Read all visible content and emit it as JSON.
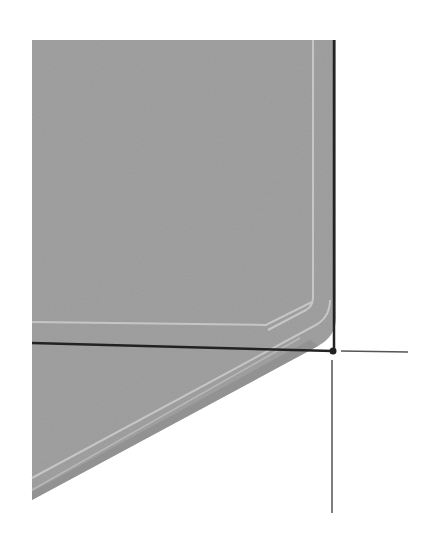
{
  "figure": {
    "caption": "",
    "colors": {
      "background": "#ffffff",
      "plate_fill": "#9a9a9a",
      "inner_outline": "#c4c4c4",
      "axis_line": "#222222",
      "thin_line": "#444444"
    },
    "plate": {
      "top_left": [
        32,
        40
      ],
      "top_right": [
        336,
        40
      ],
      "corner_start": [
        336,
        318
      ],
      "corner_radius": 22,
      "diagonal_end": [
        32,
        500
      ]
    },
    "inner_outline": {
      "vertical_x": 313,
      "horizontal_y": 322
    },
    "axes": {
      "vertical_x": 334,
      "vertical_top": 40,
      "horizontal_y": 343,
      "horizontal_left": 32,
      "origin_dot": [
        333,
        351
      ],
      "right_tick": {
        "from": 341,
        "to": 408,
        "y": 351
      },
      "down_tick": {
        "x": 332,
        "from": 360,
        "to": 513
      }
    }
  }
}
